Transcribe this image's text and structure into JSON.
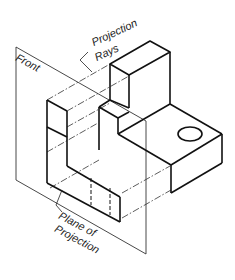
{
  "diagram": {
    "labels": {
      "front": "Front",
      "projection_rays_line1": "Projection",
      "projection_rays_line2": "Rays",
      "plane_line1": "Plane of",
      "plane_line2": "Projection"
    },
    "colors": {
      "object_line": "#111111",
      "plane_line": "#333333",
      "ray_line": "#333333",
      "background": "#ffffff"
    }
  }
}
